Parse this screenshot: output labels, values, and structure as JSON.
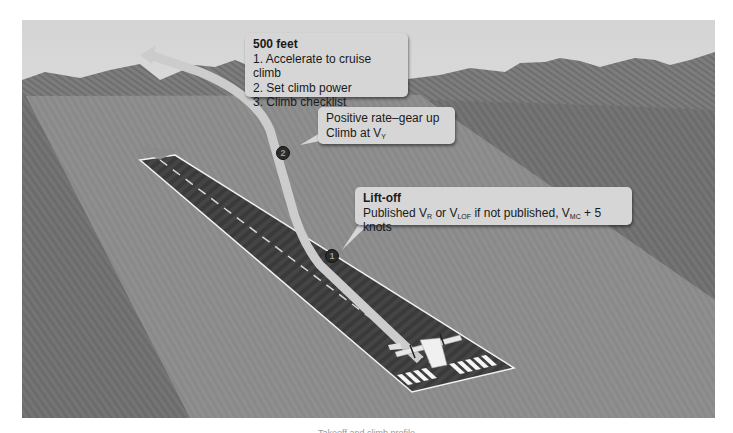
{
  "figure": {
    "background_colors": {
      "sky_top": "#d9d9d9",
      "sky_bottom": "#f2f2f2",
      "mountains": "#7a7a7a",
      "ground_dark": "#767676",
      "ground_light": "#8e8e8e",
      "runway": "#3e3e3e",
      "runway_marking": "#ffffff",
      "climb_path": "#cfcfcf",
      "callout_fill": "#d6d6d6"
    },
    "callouts": [
      {
        "id": "500-feet",
        "marker": "3",
        "title": "500 feet",
        "lines": [
          "1. Accelerate to cruise climb",
          "2. Set climb power",
          "3. Climb checklist"
        ]
      },
      {
        "id": "positive-rate",
        "marker": "2",
        "line1": "Positive rate–gear up",
        "line2_prefix": "Climb at V",
        "line2_sub": "Y"
      },
      {
        "id": "lift-off",
        "marker": "1",
        "title": "Lift-off",
        "text": {
          "p1": "Published V",
          "s1": "R",
          "p2": " or V",
          "s2": "LOF",
          "p3": " if not published, V",
          "s3": "MC",
          "p4": " + 5 knots"
        }
      }
    ],
    "markers": [
      "1",
      "2",
      "3"
    ],
    "icons": [
      "airplane-icon",
      "climb-path-arrow-icon",
      "runway-direction-arrow-icon"
    ],
    "caption": "Takeoff and climb profile"
  }
}
